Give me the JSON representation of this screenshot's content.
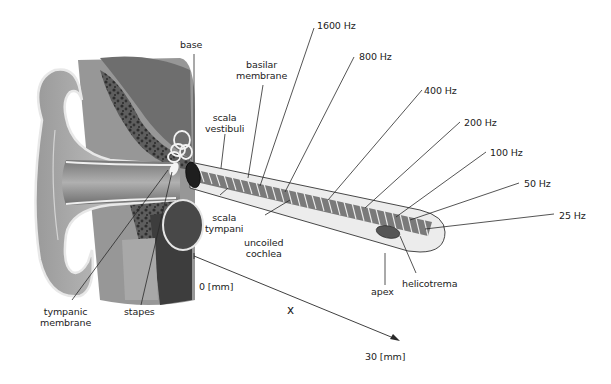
{
  "diagram": {
    "labels": {
      "base": "base",
      "basilar_membrane_1": "basilar",
      "basilar_membrane_2": "membrane",
      "scala_vestibuli_1": "scala",
      "scala_vestibuli_2": "vestibuli",
      "scala_tympani_1": "scala",
      "scala_tympani_2": "tympani",
      "uncoiled_cochlea_1": "uncoiled",
      "uncoiled_cochlea_2": "cochlea",
      "tympanic_membrane_1": "tympanic",
      "tympanic_membrane_2": "membrane",
      "stapes": "stapes",
      "apex": "apex",
      "helicotrema": "helicotrema"
    },
    "frequencies": [
      "1600 Hz",
      "800 Hz",
      "400 Hz",
      "200 Hz",
      "100 Hz",
      "50 Hz",
      "25 Hz"
    ],
    "axis": {
      "variable": "x",
      "start": "0 [mm]",
      "end": "30 [mm]"
    },
    "colors": {
      "ink": "#222222",
      "tube_fill": "#ececec",
      "membrane": "#6a6a6a",
      "ear_dark": "#3a3a3a",
      "ear_mid": "#8a8a8a",
      "ear_light": "#c4c4c4"
    }
  }
}
